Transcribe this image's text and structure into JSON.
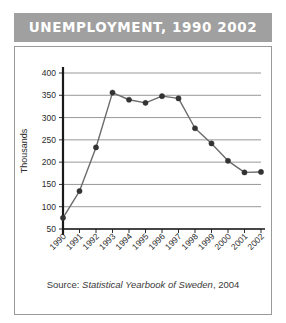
{
  "title": {
    "text": "UNEMPLOYMENT, 1990  2002"
  },
  "caption": {
    "label": "Source: ",
    "publication": "Statistical Yearbook of Sweden",
    "year": ", 2004"
  },
  "colors": {
    "title_bar_background": "#a0a0a0",
    "title_text": "#ffffff",
    "frame_border": "#9a9a9a",
    "gridline": "#8c8c8c",
    "axis": "#1a1a1a",
    "series_line": "#6b6b6b",
    "marker": "#333333",
    "background": "#ffffff"
  },
  "chart_data": {
    "type": "line",
    "title": "UNEMPLOYMENT, 1990  2002",
    "xlabel": "",
    "ylabel": "Thousands",
    "ylim": [
      50,
      400
    ],
    "yticks": [
      50,
      100,
      150,
      200,
      250,
      300,
      350,
      400
    ],
    "ytick_labels": [
      "50",
      "100",
      "150",
      "200",
      "250",
      "300",
      "350",
      "400"
    ],
    "grid": true,
    "legend": false,
    "categories": [
      "1990",
      "1991",
      "1992",
      "1993",
      "1994",
      "1995",
      "1996",
      "1997",
      "1998",
      "1999",
      "2000",
      "2001",
      "2002"
    ],
    "x": [
      1990,
      1991,
      1992,
      1993,
      1994,
      1995,
      1996,
      1997,
      1998,
      1999,
      2000,
      2001,
      2002
    ],
    "values": [
      75,
      135,
      233,
      356,
      340,
      333,
      348,
      343,
      276,
      242,
      203,
      177,
      178
    ],
    "series": [
      {
        "name": "Unemployment",
        "values": [
          75,
          135,
          233,
          356,
          340,
          333,
          348,
          343,
          276,
          242,
          203,
          177,
          178
        ]
      }
    ],
    "xtick_rotation": 45,
    "marker": "circle"
  }
}
